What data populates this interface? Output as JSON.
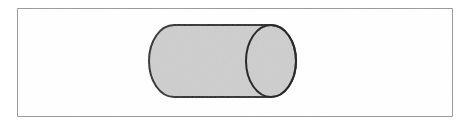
{
  "figure": {
    "name": "cylinder-diagram",
    "canvas": {
      "width": 470,
      "height": 123,
      "background_color": "#ffffff"
    },
    "frame": {
      "name": "outer-border-rectangle",
      "x": 17,
      "y": 8,
      "width": 435,
      "height": 108,
      "stroke_color": "#9a9a9a",
      "stroke_width": 1,
      "fill_color": "#ffffff"
    },
    "shape": {
      "name": "cylinder",
      "type": "cylinder",
      "orientation": "horizontal",
      "fill_color": "#cecece",
      "stroke_color": "#2b2b2b",
      "stroke_width": 2,
      "body": {
        "name": "cylinder-body",
        "left_x": 149,
        "right_x": 296,
        "top_y": 25,
        "bottom_y": 97,
        "length": 147,
        "diameter": 72
      },
      "left_cap": {
        "name": "cylinder-left-cap",
        "type": "half-ellipse",
        "center_x": 174,
        "center_y": 61,
        "radius_x": 25,
        "radius_y": 36,
        "visible": "silhouette-only"
      },
      "right_cap": {
        "name": "cylinder-right-face",
        "type": "ellipse",
        "center_x": 271,
        "center_y": 61,
        "radius_x": 25,
        "radius_y": 36,
        "visible": "full"
      }
    }
  }
}
